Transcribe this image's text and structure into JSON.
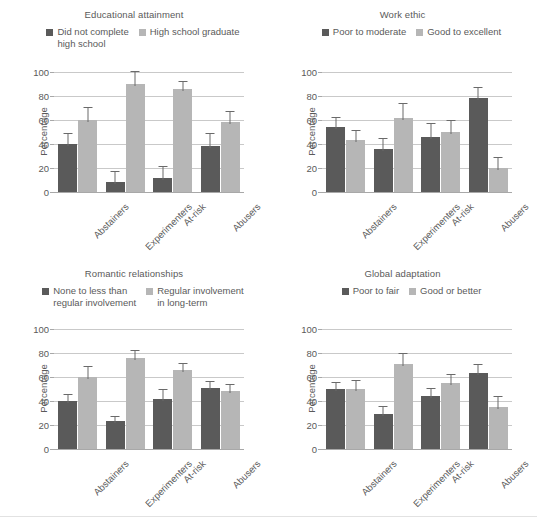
{
  "figure": {
    "ylabel": "Percentage",
    "yticks": [
      0,
      20,
      40,
      60,
      80,
      100
    ],
    "categories": [
      "Abstainers",
      "Experimenters",
      "At-risk",
      "Abusers"
    ],
    "colors": {
      "dark": "#5a5a5a",
      "light": "#b6b6b6",
      "grid": "#c9c9c9",
      "text": "#5a5a5a"
    }
  },
  "panels": [
    {
      "title": "Educational attainment",
      "legend": [
        "Did not complete\nhigh school",
        "High school graduate"
      ]
    },
    {
      "title": "Work ethic",
      "legend": [
        "Poor to moderate",
        "Good to excellent"
      ]
    },
    {
      "title": "Romantic relationships",
      "legend": [
        "None to less than\nregular involvement",
        "Regular involvement\nin long-term"
      ]
    },
    {
      "title": "Global adaptation",
      "legend": [
        "Poor to fair",
        "Good or better"
      ]
    }
  ],
  "chart_data": [
    {
      "type": "bar",
      "title": "Educational attainment",
      "xlabel": "",
      "ylabel": "Percentage",
      "ylim": [
        0,
        100
      ],
      "yticks": [
        0,
        20,
        40,
        60,
        80,
        100
      ],
      "grid": true,
      "legend_position": "top",
      "categories": [
        "Abstainers",
        "Experimenters",
        "At-risk",
        "Abusers"
      ],
      "series": [
        {
          "name": "Did not complete high school",
          "color": "#5a5a5a",
          "values": [
            40,
            8,
            12,
            38
          ],
          "errors": [
            8,
            9,
            9,
            10
          ]
        },
        {
          "name": "High school graduate",
          "color": "#b6b6b6",
          "values": [
            60,
            90,
            86,
            58
          ],
          "errors": [
            10,
            10,
            6,
            9
          ]
        }
      ]
    },
    {
      "type": "bar",
      "title": "Work ethic",
      "xlabel": "",
      "ylabel": "Percentage",
      "ylim": [
        0,
        100
      ],
      "yticks": [
        0,
        20,
        40,
        60,
        80,
        100
      ],
      "grid": true,
      "legend_position": "top",
      "categories": [
        "Abstainers",
        "Experimenters",
        "At-risk",
        "Abusers"
      ],
      "series": [
        {
          "name": "Poor to moderate",
          "color": "#5a5a5a",
          "values": [
            54,
            36,
            46,
            78
          ],
          "errors": [
            8,
            8,
            11,
            9
          ]
        },
        {
          "name": "Good to excellent",
          "color": "#b6b6b6",
          "values": [
            43,
            62,
            50,
            20
          ],
          "errors": [
            8,
            11,
            9,
            8
          ]
        }
      ]
    },
    {
      "type": "bar",
      "title": "Romantic relationships",
      "xlabel": "",
      "ylabel": "Percentage",
      "ylim": [
        0,
        100
      ],
      "yticks": [
        0,
        20,
        40,
        60,
        80,
        100
      ],
      "grid": true,
      "legend_position": "top",
      "categories": [
        "Abstainers",
        "Experimenters",
        "At-risk",
        "Abusers"
      ],
      "series": [
        {
          "name": "None to less than regular involvement",
          "color": "#5a5a5a",
          "values": [
            40,
            23,
            42,
            51
          ],
          "errors": [
            5,
            4,
            7,
            5
          ]
        },
        {
          "name": "Regular involvement in long-term",
          "color": "#b6b6b6",
          "values": [
            60,
            76,
            66,
            48
          ],
          "errors": [
            8,
            6,
            5,
            5
          ]
        }
      ]
    },
    {
      "type": "bar",
      "title": "Global adaptation",
      "xlabel": "",
      "ylabel": "Percentage",
      "ylim": [
        0,
        100
      ],
      "yticks": [
        0,
        20,
        40,
        60,
        80,
        100
      ],
      "grid": true,
      "legend_position": "top",
      "categories": [
        "Abstainers",
        "Experimenters",
        "At-risk",
        "Abusers"
      ],
      "series": [
        {
          "name": "Poor to fair",
          "color": "#5a5a5a",
          "values": [
            50,
            29,
            44,
            63
          ],
          "errors": [
            5,
            6,
            6,
            7
          ]
        },
        {
          "name": "Good or better",
          "color": "#b6b6b6",
          "values": [
            50,
            71,
            55,
            35
          ],
          "errors": [
            7,
            8,
            7,
            8
          ]
        }
      ]
    }
  ]
}
